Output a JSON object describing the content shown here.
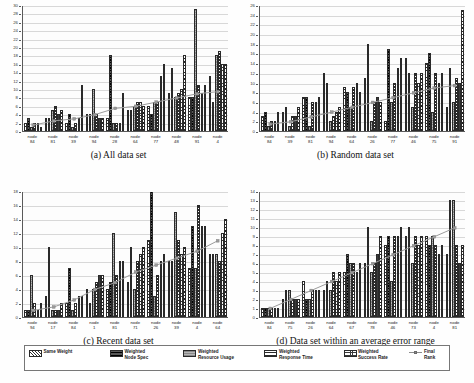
{
  "figure": {
    "ylabel": "Rank",
    "series_names": [
      "Same Weight",
      "Weighted Node Spec",
      "Weighted Resource Usage",
      "Weighted Response Time",
      "Weighted Success Rate",
      "Final Rank"
    ],
    "legend": [
      {
        "label": "Same Weight",
        "pattern": "diagonal-hatch",
        "type": "bar"
      },
      {
        "label": "Weighted\nNode Spec",
        "pattern": "dark-horizontal",
        "type": "bar"
      },
      {
        "label": "Weighted\nResource Usage",
        "pattern": "gray-solid",
        "type": "bar"
      },
      {
        "label": "Weighted\nResponse Time",
        "pattern": "fine-horizontal",
        "type": "bar"
      },
      {
        "label": "Weighted\nSuccess Rate",
        "pattern": "cross-hatch",
        "type": "bar"
      },
      {
        "label": "Final Rank",
        "pattern": "line-marker",
        "type": "line",
        "color": "#8d8d8d"
      }
    ]
  },
  "chart_data": [
    {
      "type": "bar",
      "title": "(a) All data set",
      "xlabel": "",
      "ylabel": "Rank",
      "ylim": [
        0,
        30
      ],
      "ytick_step": 2,
      "grid": true,
      "legend_position": "bottom-shared",
      "categories": [
        "node\n84",
        "node\n81",
        "node\n39",
        "node\n94",
        "node\n28",
        "node\n64",
        "node\n77",
        "node\n48",
        "node\n91",
        "node\n4"
      ],
      "series": [
        {
          "name": "Same Weight",
          "values": [
            2,
            3,
            2,
            4,
            3,
            5,
            6,
            9,
            8,
            13
          ]
        },
        {
          "name": "Weighted Node Spec",
          "values": [
            3,
            3,
            4,
            4,
            18,
            5,
            4,
            15,
            8,
            7
          ]
        },
        {
          "name": "Weighted Resource Usage",
          "values": [
            1,
            5,
            1,
            10,
            2,
            6,
            7,
            8,
            29,
            18
          ]
        },
        {
          "name": "Weighted Response Time",
          "values": [
            2,
            6,
            2,
            4,
            2,
            7,
            7,
            9,
            11,
            19
          ]
        },
        {
          "name": "Weighted Success Rate",
          "values": [
            2,
            4,
            3,
            3,
            2,
            7,
            13,
            10,
            9,
            16
          ]
        },
        {
          "name": "Same Weight (alt)",
          "values": [
            1,
            5,
            11,
            3,
            9,
            6,
            16,
            18,
            11,
            16
          ]
        }
      ],
      "line_series": {
        "name": "Final Rank",
        "values": [
          1.5,
          2.5,
          3,
          4,
          5.5,
          6,
          7,
          8,
          9,
          9.5
        ]
      }
    },
    {
      "type": "bar",
      "title": "(b) Random data set",
      "xlabel": "",
      "ylabel": "Rank",
      "ylim": [
        0,
        26
      ],
      "ytick_step": 2,
      "grid": true,
      "legend_position": "bottom-shared",
      "categories": [
        "node\n84",
        "node\n39",
        "node\n81",
        "node\n94",
        "node\n64",
        "node\n26",
        "node\n77",
        "node\n46",
        "node\n75",
        "node\n91"
      ],
      "series": [
        {
          "name": "Same Weight",
          "values": [
            3,
            4,
            7,
            12,
            9,
            11,
            2,
            15,
            14,
            5
          ]
        },
        {
          "name": "Weighted Node Spec",
          "values": [
            4,
            5,
            7,
            10,
            8,
            18,
            17,
            12,
            16,
            13
          ]
        },
        {
          "name": "Weighted Resource Usage",
          "values": [
            1,
            1,
            1,
            2,
            5,
            2,
            6,
            5,
            4,
            6
          ]
        },
        {
          "name": "Weighted Response Time",
          "values": [
            2,
            3,
            6,
            3,
            9,
            6,
            10,
            12,
            12,
            11
          ]
        },
        {
          "name": "Weighted Success Rate",
          "values": [
            2,
            3,
            6,
            4,
            10,
            7,
            13,
            10,
            10,
            10
          ]
        },
        {
          "name": "Same Weight (alt)",
          "values": [
            4,
            5,
            7,
            5,
            8,
            6,
            15,
            12,
            12,
            25
          ]
        }
      ],
      "line_series": {
        "name": "Final Rank",
        "values": [
          1.5,
          2,
          3,
          4,
          5,
          6,
          7,
          8,
          9,
          9.5
        ]
      }
    },
    {
      "type": "bar",
      "title": "(c) Recent data set",
      "xlabel": "",
      "ylabel": "Rank",
      "ylim": [
        0,
        18
      ],
      "ytick_step": 2,
      "grid": true,
      "legend_position": "bottom-shared",
      "categories": [
        "node\n94",
        "node\n17",
        "node\n84",
        "node\n1",
        "node\n81",
        "node\n71",
        "node\n26",
        "node\n39",
        "node\n4",
        "node\n64"
      ],
      "series": [
        {
          "name": "Same Weight",
          "values": [
            1,
            3,
            2,
            4,
            4,
            5,
            11,
            8,
            7,
            9
          ]
        },
        {
          "name": "Weighted Node Spec",
          "values": [
            1,
            10,
            7,
            2,
            5,
            10,
            18,
            8,
            13,
            9
          ]
        },
        {
          "name": "Weighted Resource Usage",
          "values": [
            6,
            1,
            1,
            4,
            12,
            4,
            3,
            15,
            7,
            9
          ]
        },
        {
          "name": "Weighted Response Time",
          "values": [
            2,
            1,
            2,
            5,
            6,
            8,
            6,
            11,
            16,
            8
          ]
        },
        {
          "name": "Weighted Success Rate",
          "values": [
            1,
            1,
            3,
            6,
            8,
            9,
            8,
            9,
            13,
            12
          ]
        },
        {
          "name": "Same Weight (alt)",
          "values": [
            2,
            2,
            3,
            6,
            8,
            10,
            9,
            10,
            13,
            14
          ]
        }
      ],
      "line_series": {
        "name": "Final Rank",
        "values": [
          1,
          1.5,
          2.5,
          4,
          5,
          6.5,
          7.5,
          8.5,
          9.5,
          11
        ]
      }
    },
    {
      "type": "bar",
      "title": "(d) Data set within an average error range",
      "xlabel": "",
      "ylabel": "Rank",
      "ylim": [
        0,
        14
      ],
      "ytick_step": 1,
      "grid": true,
      "legend_position": "bottom-shared",
      "categories": [
        "node\n84",
        "node\n75",
        "node\n26",
        "node\n64",
        "node\n67",
        "node\n78",
        "node\n46",
        "node\n73",
        "node\n4",
        "node\n81"
      ],
      "series": [
        {
          "name": "Same Weight",
          "values": [
            1,
            2,
            4,
            3,
            5,
            6,
            8,
            9,
            9,
            7
          ]
        },
        {
          "name": "Weighted Node Spec",
          "values": [
            1,
            3,
            2,
            4,
            7,
            10,
            9,
            10,
            8,
            13
          ]
        },
        {
          "name": "Weighted Resource Usage",
          "values": [
            1,
            3,
            2,
            3,
            6,
            5,
            4,
            6,
            9,
            13
          ]
        },
        {
          "name": "Weighted Response Time",
          "values": [
            1,
            2,
            3,
            5,
            6,
            6,
            9,
            9,
            8,
            8
          ]
        },
        {
          "name": "Weighted Success Rate",
          "values": [
            1,
            2,
            3,
            4,
            5,
            7,
            9,
            8,
            7,
            6
          ]
        },
        {
          "name": "Same Weight (alt)",
          "values": [
            1,
            2,
            3,
            5,
            6,
            9,
            10,
            9,
            8,
            8
          ]
        }
      ],
      "line_series": {
        "name": "Final Rank",
        "values": [
          1,
          2,
          3,
          4,
          5,
          6,
          7,
          8,
          9,
          10
        ]
      }
    }
  ]
}
